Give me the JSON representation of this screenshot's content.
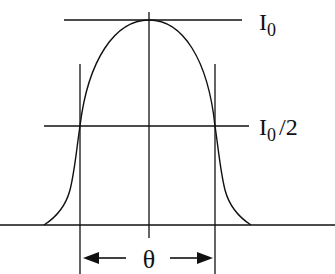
{
  "diagram": {
    "type": "intensity-profile",
    "labels": {
      "peak": {
        "main": "I",
        "sub": "0",
        "suffix": ""
      },
      "half": {
        "main": "I",
        "sub": "0",
        "suffix": "/2"
      },
      "width": "θ"
    },
    "colors": {
      "line": "#111111",
      "background": "#ffffff"
    }
  }
}
